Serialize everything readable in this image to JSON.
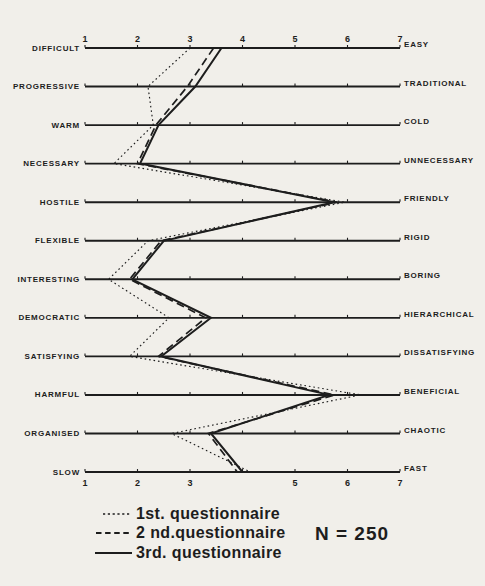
{
  "figure": {
    "ink": "#1d1d1d",
    "paper": "#f1efea"
  },
  "chart_data": {
    "type": "line",
    "variant": "semantic-differential-profile",
    "scale_min": 1,
    "scale_max": 7,
    "grid": false,
    "legend_position": "bottom-left",
    "top_tick_labels": [
      "1",
      "2",
      "3",
      "4",
      "5",
      "6",
      "7"
    ],
    "bottom_tick_labels": [
      "1",
      "2",
      "3",
      "",
      "5",
      "6",
      "7"
    ],
    "rows": [
      {
        "left": "DIFFICULT",
        "right": "EASY"
      },
      {
        "left": "PROGRESSIVE",
        "right": "TRADITIONAL"
      },
      {
        "left": "WARM",
        "right": "COLD"
      },
      {
        "left": "NECESSARY",
        "right": "UNNECESSARY"
      },
      {
        "left": "HOSTILE",
        "right": "FRIENDLY"
      },
      {
        "left": "FLEXIBLE",
        "right": "RIGID"
      },
      {
        "left": "INTERESTING",
        "right": "BORING"
      },
      {
        "left": "DEMOCRATIC",
        "right": "HIERARCHICAL"
      },
      {
        "left": "SATISFYING",
        "right": "DISSATISFYING"
      },
      {
        "left": "HARMFUL",
        "right": "BENEFICIAL"
      },
      {
        "left": "ORGANISED",
        "right": "CHAOTIC"
      },
      {
        "left": "SLOW",
        "right": "FAST"
      }
    ],
    "series": [
      {
        "name": "1st. questionnaire",
        "style": "dotted",
        "values": [
          3.0,
          2.2,
          2.3,
          1.55,
          5.95,
          2.2,
          1.45,
          2.6,
          1.85,
          6.25,
          2.65,
          4.15
        ]
      },
      {
        "name": "2 nd.questionnaire",
        "style": "dashed",
        "values": [
          3.45,
          2.95,
          2.35,
          2.0,
          5.8,
          2.45,
          1.85,
          3.3,
          2.4,
          5.75,
          3.35,
          3.9
        ]
      },
      {
        "name": "3rd. questionnaire",
        "style": "solid",
        "values": [
          3.6,
          3.1,
          2.4,
          2.05,
          5.75,
          2.5,
          1.9,
          3.4,
          2.45,
          5.65,
          3.4,
          4.0
        ]
      }
    ],
    "annotation": "N = 250"
  }
}
